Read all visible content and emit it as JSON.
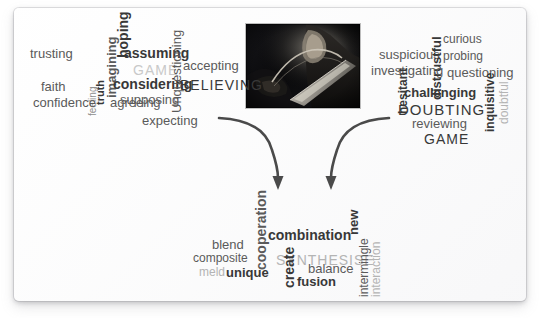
{
  "diagram": {
    "background_color": "#ffffff",
    "card_color": "#fdfdfd",
    "photo": {
      "name": "centre-photograph",
      "description": "dark monochrome photograph of a person holding a large blade",
      "alt": "",
      "x": 246,
      "y": 24,
      "width": 114,
      "height": 84
    },
    "arrows": {
      "name": "converging-arrows",
      "count": 2,
      "direction": "down",
      "color": "#4a4a4a",
      "description": "two curved arrows converging downward from the left and right clouds toward the bottom cloud"
    }
  },
  "clouds": [
    {
      "id": "believing",
      "name": "believing-word-cloud",
      "headword": "BELIEVING",
      "position": "top-left",
      "words": [
        {
          "text": "trusting",
          "x": 30,
          "y": 47,
          "size": 13,
          "weight": 400,
          "tone": "t-mid",
          "rot": 0
        },
        {
          "text": "hoping",
          "x": 116,
          "y": 58,
          "size": 14,
          "weight": 700,
          "tone": "t-dark",
          "rot": -90
        },
        {
          "text": "imagining",
          "x": 105,
          "y": 98,
          "size": 13,
          "weight": 700,
          "tone": "t-mid",
          "rot": -90
        },
        {
          "text": "truth",
          "x": 95,
          "y": 105,
          "size": 11,
          "weight": 700,
          "tone": "t-dark",
          "rot": -90
        },
        {
          "text": "feeling",
          "x": 88,
          "y": 116,
          "size": 10,
          "weight": 400,
          "tone": "t-gray",
          "rot": -90
        },
        {
          "text": "assuming",
          "x": 124,
          "y": 46,
          "size": 14,
          "weight": 700,
          "tone": "t-dark",
          "rot": 0
        },
        {
          "text": "GAME",
          "x": 133,
          "y": 63,
          "size": 14,
          "weight": 400,
          "tone": "t-pale",
          "rot": 0
        },
        {
          "text": "considering",
          "x": 113,
          "y": 77,
          "size": 14,
          "weight": 700,
          "tone": "t-dark",
          "rot": 0
        },
        {
          "text": "supposing",
          "x": 120,
          "y": 93,
          "size": 13,
          "weight": 400,
          "tone": "t-mid",
          "rot": 0
        },
        {
          "text": "faith",
          "x": 41,
          "y": 80,
          "size": 13,
          "weight": 400,
          "tone": "t-mid",
          "rot": 0
        },
        {
          "text": "confidence",
          "x": 33,
          "y": 96,
          "size": 13,
          "weight": 400,
          "tone": "t-mid",
          "rot": 0
        },
        {
          "text": "agreeing",
          "x": 110,
          "y": 96,
          "size": 13,
          "weight": 400,
          "tone": "t-mid",
          "rot": 0
        },
        {
          "text": "Unquestioning",
          "x": 170,
          "y": 113,
          "size": 13,
          "weight": 400,
          "tone": "t-mid",
          "rot": -90
        },
        {
          "text": "accepting",
          "x": 183,
          "y": 59,
          "size": 13,
          "weight": 400,
          "tone": "t-mid",
          "rot": 0
        },
        {
          "text": "BELIEVING",
          "x": 180,
          "y": 78,
          "size": 14,
          "weight": 400,
          "tone": "t-dark",
          "rot": 0
        },
        {
          "text": "expecting",
          "x": 142,
          "y": 114,
          "size": 13,
          "weight": 400,
          "tone": "t-mid",
          "rot": 0
        }
      ]
    },
    {
      "id": "doubting",
      "name": "doubting-word-cloud",
      "headword": "DOUBTING",
      "position": "top-right",
      "words": [
        {
          "text": "suspicious",
          "x": 379,
          "y": 48,
          "size": 13,
          "weight": 400,
          "tone": "t-mid",
          "rot": 0
        },
        {
          "text": "distrustful",
          "x": 430,
          "y": 100,
          "size": 13,
          "weight": 700,
          "tone": "t-dark",
          "rot": -90
        },
        {
          "text": "curious",
          "x": 443,
          "y": 33,
          "size": 12,
          "weight": 400,
          "tone": "t-mid",
          "rot": 0
        },
        {
          "text": "probing",
          "x": 443,
          "y": 50,
          "size": 12,
          "weight": 400,
          "tone": "t-mid",
          "rot": 0
        },
        {
          "text": "investigating",
          "x": 371,
          "y": 64,
          "size": 13,
          "weight": 400,
          "tone": "t-mid",
          "rot": 0
        },
        {
          "text": "questioning",
          "x": 447,
          "y": 66,
          "size": 13,
          "weight": 400,
          "tone": "t-mid",
          "rot": 0
        },
        {
          "text": "hesitant",
          "x": 397,
          "y": 114,
          "size": 12,
          "weight": 700,
          "tone": "t-dark",
          "rot": -90
        },
        {
          "text": "challenging",
          "x": 404,
          "y": 86,
          "size": 13,
          "weight": 700,
          "tone": "t-dark",
          "rot": 0
        },
        {
          "text": "DOUBTING",
          "x": 398,
          "y": 102,
          "size": 15,
          "weight": 400,
          "tone": "t-dark",
          "rot": 0
        },
        {
          "text": "reviewing",
          "x": 412,
          "y": 117,
          "size": 13,
          "weight": 400,
          "tone": "t-mid",
          "rot": 0
        },
        {
          "text": "GAME",
          "x": 424,
          "y": 132,
          "size": 14,
          "weight": 400,
          "tone": "t-dark",
          "rot": 0
        },
        {
          "text": "inquisitive",
          "x": 484,
          "y": 132,
          "size": 12,
          "weight": 700,
          "tone": "t-dark",
          "rot": -90
        },
        {
          "text": "doubtful",
          "x": 498,
          "y": 124,
          "size": 12,
          "weight": 400,
          "tone": "t-light",
          "rot": -90
        }
      ]
    },
    {
      "id": "synthesise",
      "name": "synthesise-word-cloud",
      "headword": "SYNTHESISE",
      "position": "bottom-centre",
      "words": [
        {
          "text": "cooperation",
          "x": 254,
          "y": 270,
          "size": 14,
          "weight": 700,
          "tone": "t-mid",
          "rot": -90
        },
        {
          "text": "combination",
          "x": 268,
          "y": 228,
          "size": 14,
          "weight": 700,
          "tone": "t-dark",
          "rot": 0
        },
        {
          "text": "new",
          "x": 347,
          "y": 235,
          "size": 13,
          "weight": 700,
          "tone": "t-dark",
          "rot": -90
        },
        {
          "text": "blend",
          "x": 212,
          "y": 238,
          "size": 13,
          "weight": 400,
          "tone": "t-mid",
          "rot": 0
        },
        {
          "text": "SYNTHESISE",
          "x": 276,
          "y": 253,
          "size": 14,
          "weight": 400,
          "tone": "t-light",
          "rot": 0
        },
        {
          "text": "composite",
          "x": 193,
          "y": 252,
          "size": 12,
          "weight": 400,
          "tone": "t-mid",
          "rot": 0
        },
        {
          "text": "meld",
          "x": 199,
          "y": 266,
          "size": 12,
          "weight": 400,
          "tone": "t-light",
          "rot": 0
        },
        {
          "text": "unique",
          "x": 226,
          "y": 266,
          "size": 13,
          "weight": 700,
          "tone": "t-dark",
          "rot": 0
        },
        {
          "text": "create",
          "x": 282,
          "y": 288,
          "size": 14,
          "weight": 700,
          "tone": "t-dark",
          "rot": -90
        },
        {
          "text": "balance",
          "x": 308,
          "y": 262,
          "size": 13,
          "weight": 400,
          "tone": "t-mid",
          "rot": 0
        },
        {
          "text": "fusion",
          "x": 297,
          "y": 275,
          "size": 13,
          "weight": 700,
          "tone": "t-dark",
          "rot": 0
        },
        {
          "text": "intermingle",
          "x": 358,
          "y": 297,
          "size": 12,
          "weight": 400,
          "tone": "t-mid",
          "rot": -90
        },
        {
          "text": "interaction",
          "x": 370,
          "y": 297,
          "size": 12,
          "weight": 400,
          "tone": "t-light",
          "rot": -90
        }
      ]
    }
  ]
}
